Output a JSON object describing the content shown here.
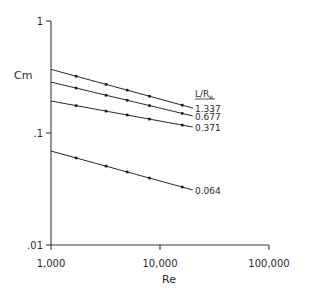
{
  "chart_data": {
    "type": "line",
    "title": "",
    "xlabel": "Re",
    "ylabel": "Cm",
    "xscale": "log",
    "yscale": "log",
    "xlim": [
      1000,
      100000
    ],
    "ylim": [
      0.01,
      1
    ],
    "x_ticks": [
      {
        "value": 1000,
        "label": "1,000"
      },
      {
        "value": 10000,
        "label": "10,000"
      },
      {
        "value": 100000,
        "label": "100,000"
      }
    ],
    "y_ticks": [
      {
        "value": 1,
        "label": "1"
      },
      {
        "value": 0.1,
        "label": ".1"
      },
      {
        "value": 0.01,
        "label": ".01"
      }
    ],
    "grid": false,
    "legend": {
      "title": "L/R",
      "title_subscript": "e",
      "position": "inline-right-of-lines"
    },
    "series": [
      {
        "name": "1.337",
        "line": {
          "x": [
            1000,
            20000
          ],
          "y": [
            0.37,
            0.167
          ]
        },
        "markers_x": [
          1700,
          3200,
          5000,
          8000,
          16000
        ]
      },
      {
        "name": "0.677",
        "line": {
          "x": [
            1000,
            20000
          ],
          "y": [
            0.285,
            0.142
          ]
        },
        "markers_x": [
          1700,
          3200,
          5000,
          8000,
          16000
        ]
      },
      {
        "name": "0.371",
        "line": {
          "x": [
            1000,
            20000
          ],
          "y": [
            0.193,
            0.113
          ]
        },
        "markers_x": [
          1700,
          3200,
          5000,
          8000,
          16000
        ]
      },
      {
        "name": "0.064",
        "line": {
          "x": [
            1000,
            20000
          ],
          "y": [
            0.069,
            0.031
          ]
        },
        "markers_x": [
          1700,
          3200,
          5000,
          8000,
          16000
        ]
      }
    ]
  },
  "layout": {
    "plot": {
      "x0": 51,
      "x_decade_px": 109,
      "y_top": 21,
      "y_decade_px": 112
    },
    "label_x": 195
  }
}
